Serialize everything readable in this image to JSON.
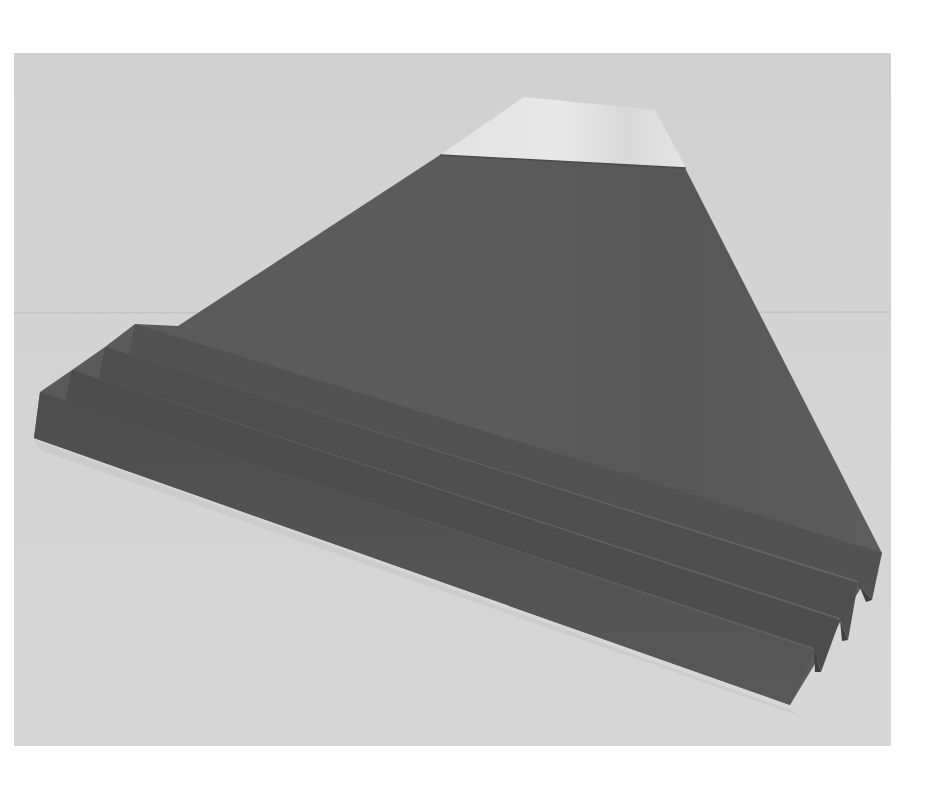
{
  "image": {
    "kind": "photograph",
    "subject": "origami paper mountain with snow cap and pleated base",
    "alt_text": "Grayscale photo of a folded paper mountain (Mt. Fuji style) with a white snowy peak and four accordion pleats at its base",
    "colors": {
      "page_background": "#ffffff",
      "photo_background_top": "#d2d2d2",
      "photo_background_bottom": "#d6d6d6",
      "horizon_line": "#c2c2c2",
      "snow_cap": "#e6e6e6",
      "snow_cap_shadow": "#cfcfcf",
      "mountain_body": "#5b5b5b",
      "mountain_body_dark": "#4f4f4f",
      "pleat_face": "#555555",
      "pleat_shadow": "#474747",
      "pleat_highlight": "#6a6a6a"
    },
    "pleat_count": 4
  }
}
